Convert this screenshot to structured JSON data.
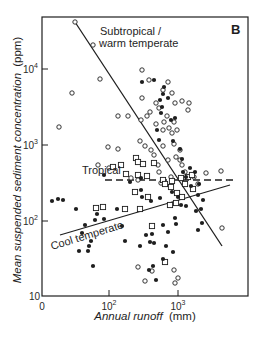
{
  "chart_data": {
    "type": "scatter",
    "panel_label": "B",
    "title": "",
    "xlabel": "Annual runoff",
    "xlabel_unit": "(mm)",
    "ylabel": "Mean suspended sediment concentration",
    "ylabel_unit": "(ppm)",
    "x_scale": "log",
    "y_scale": "log",
    "xlim": [
      1,
      10000
    ],
    "ylim": [
      10,
      60000
    ],
    "grid": false,
    "legend": "none (inline annotations)",
    "x_ticks": [
      {
        "label": "0",
        "value": 1,
        "px": 42
      },
      {
        "label": "10",
        "sup": "2",
        "value": 100,
        "px": 109
      },
      {
        "label": "10",
        "sup": "3",
        "value": 1000,
        "px": 178
      }
    ],
    "y_ticks": [
      {
        "label": "10",
        "sup": "",
        "value": 10,
        "py": 296
      },
      {
        "label": "10",
        "sup": "2",
        "value": 100,
        "py": 221
      },
      {
        "label": "10",
        "sup": "3",
        "value": 1000,
        "py": 145
      },
      {
        "label": "10",
        "sup": "4",
        "value": 10000,
        "py": 69
      }
    ],
    "annotations": [
      {
        "text": "Subtropical /",
        "x": 100,
        "y": 35
      },
      {
        "text": "warm temperate",
        "x": 99,
        "y": 47
      },
      {
        "text": "Tropical",
        "x": 82,
        "y": 174
      },
      {
        "text": "Cool temperate",
        "x": 52,
        "y": 250,
        "rotate": -17
      }
    ],
    "trend_lines": [
      {
        "name": "Subtropical / warm temperate",
        "style": "solid",
        "x1": 75,
        "y1": 22,
        "x2": 222,
        "y2": 246
      },
      {
        "name": "Tropical",
        "style": "dashed",
        "x1": 105,
        "y1": 180,
        "x2": 236,
        "y2": 180
      },
      {
        "name": "Cool temperate",
        "style": "solid",
        "x1": 60,
        "y1": 235,
        "x2": 230,
        "y2": 185
      }
    ],
    "series": [
      {
        "name": "Subtropical / warm temperate",
        "marker": "open-circle",
        "points_px": [
          [
            75,
            22
          ],
          [
            93,
            45
          ],
          [
            100,
            79
          ],
          [
            72,
            93
          ],
          [
            59,
            127
          ],
          [
            118,
            116
          ],
          [
            118,
            149
          ],
          [
            128,
            116
          ],
          [
            142,
            70
          ],
          [
            149,
            80
          ],
          [
            168,
            82
          ],
          [
            142,
            98
          ],
          [
            163,
            90
          ],
          [
            156,
            103
          ],
          [
            159,
            108
          ],
          [
            172,
            93
          ],
          [
            175,
            103
          ],
          [
            182,
            101
          ],
          [
            189,
            103
          ],
          [
            188,
            110
          ],
          [
            147,
            116
          ],
          [
            141,
            120
          ],
          [
            150,
            112
          ],
          [
            167,
            116
          ],
          [
            164,
            122
          ],
          [
            156,
            124
          ],
          [
            163,
            130
          ],
          [
            174,
            122
          ],
          [
            169,
            128
          ],
          [
            172,
            133
          ],
          [
            177,
            130
          ],
          [
            140,
            141
          ],
          [
            145,
            146
          ],
          [
            151,
            150
          ],
          [
            163,
            146
          ],
          [
            174,
            144
          ],
          [
            180,
            150
          ],
          [
            154,
            155
          ],
          [
            158,
            165
          ],
          [
            168,
            160
          ],
          [
            176,
            157
          ],
          [
            182,
            165
          ],
          [
            185,
            172
          ],
          [
            180,
            160
          ],
          [
            159,
            172
          ],
          [
            161,
            183
          ],
          [
            171,
            177
          ],
          [
            192,
            175
          ],
          [
            206,
            173
          ],
          [
            221,
            171
          ],
          [
            138,
            180
          ],
          [
            131,
            178
          ],
          [
            194,
            177
          ],
          [
            198,
            184
          ],
          [
            109,
            168
          ],
          [
            98,
            165
          ],
          [
            108,
            147
          ],
          [
            222,
            228
          ],
          [
            138,
            267
          ],
          [
            152,
            271
          ],
          [
            174,
            270
          ],
          [
            145,
            281
          ],
          [
            175,
            283
          ],
          [
            178,
            278
          ]
        ]
      },
      {
        "name": "Tropical",
        "marker": "open-square",
        "points_px": [
          [
            136,
            158
          ],
          [
            138,
            162
          ],
          [
            143,
            164
          ],
          [
            121,
            165
          ],
          [
            154,
            163
          ],
          [
            126,
            174
          ],
          [
            138,
            175
          ],
          [
            147,
            176
          ],
          [
            163,
            180
          ],
          [
            172,
            181
          ],
          [
            185,
            184
          ],
          [
            181,
            178
          ],
          [
            188,
            177
          ],
          [
            192,
            175
          ],
          [
            165,
            184
          ],
          [
            171,
            187
          ],
          [
            177,
            193
          ],
          [
            182,
            197
          ],
          [
            176,
            203
          ],
          [
            148,
            197
          ],
          [
            135,
            192
          ],
          [
            140,
            209
          ],
          [
            170,
            205
          ],
          [
            152,
            226
          ],
          [
            125,
            209
          ],
          [
            103,
            207
          ],
          [
            96,
            208
          ],
          [
            113,
            167
          ],
          [
            193,
            189
          ],
          [
            165,
            262
          ]
        ]
      },
      {
        "name": "Cool temperate",
        "marker": "filled-circle",
        "points_px": [
          [
            142,
            82
          ],
          [
            154,
            80
          ],
          [
            164,
            87
          ],
          [
            163,
            94
          ],
          [
            168,
            98
          ],
          [
            160,
            100
          ],
          [
            162,
            107
          ],
          [
            161,
            113
          ],
          [
            171,
            120
          ],
          [
            175,
            118
          ],
          [
            157,
            130
          ],
          [
            159,
            140
          ],
          [
            173,
            141
          ],
          [
            180,
            149
          ],
          [
            182,
            159
          ],
          [
            183,
            172
          ],
          [
            190,
            168
          ],
          [
            195,
            172
          ],
          [
            186,
            177
          ],
          [
            191,
            186
          ],
          [
            199,
            184
          ],
          [
            198,
            195
          ],
          [
            203,
            200
          ],
          [
            186,
            206
          ],
          [
            196,
            211
          ],
          [
            201,
            209
          ],
          [
            202,
            223
          ],
          [
            198,
            230
          ],
          [
            141,
            178
          ],
          [
            141,
            190
          ],
          [
            130,
            182
          ],
          [
            104,
            175
          ],
          [
            142,
            197
          ],
          [
            151,
            201
          ],
          [
            160,
            198
          ],
          [
            172,
            192
          ],
          [
            178,
            197
          ],
          [
            181,
            205
          ],
          [
            175,
            218
          ],
          [
            176,
            224
          ],
          [
            168,
            232
          ],
          [
            163,
            225
          ],
          [
            146,
            235
          ],
          [
            152,
            234
          ],
          [
            150,
            242
          ],
          [
            154,
            243
          ],
          [
            140,
            246
          ],
          [
            125,
            241
          ],
          [
            122,
            226
          ],
          [
            117,
            209
          ],
          [
            97,
            214
          ],
          [
            95,
            220
          ],
          [
            104,
            219
          ],
          [
            85,
            225
          ],
          [
            82,
            233
          ],
          [
            91,
            241
          ],
          [
            89,
            246
          ],
          [
            52,
            201
          ],
          [
            58,
            199
          ],
          [
            63,
            200
          ],
          [
            76,
            209
          ],
          [
            79,
            251
          ],
          [
            88,
            251
          ],
          [
            93,
            266
          ],
          [
            163,
            259
          ],
          [
            153,
            266
          ],
          [
            156,
            280
          ],
          [
            149,
            270
          ],
          [
            166,
            246
          ],
          [
            173,
            252
          ]
        ]
      }
    ]
  }
}
